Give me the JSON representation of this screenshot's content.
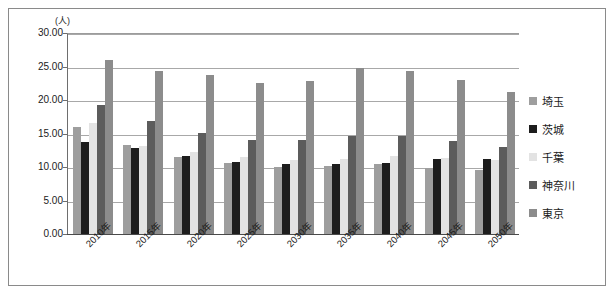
{
  "chart_data": {
    "type": "bar",
    "title": "",
    "subtitle": "",
    "xlabel": "",
    "ylabel": "",
    "unit_label": "(人)",
    "ylim": [
      0,
      30
    ],
    "ytick_step": 5,
    "ytick_labels": [
      "30.00",
      "25.00",
      "20.00",
      "15.00",
      "10.00",
      "5.00",
      "0.00"
    ],
    "ytick_values": [
      30,
      25,
      20,
      15,
      10,
      5,
      0
    ],
    "grid": true,
    "legend_position": "right",
    "categories": [
      "2010年",
      "2015年",
      "2020年",
      "2025年",
      "2030年",
      "2035年",
      "2040年",
      "2045年",
      "2050年"
    ],
    "series": [
      {
        "name": "埼玉",
        "color": "#9e9e9e",
        "values": [
          15.9,
          13.3,
          11.5,
          10.6,
          10.0,
          10.1,
          10.4,
          9.9,
          9.6
        ]
      },
      {
        "name": "茨城",
        "color": "#1d1d1d",
        "values": [
          13.7,
          12.9,
          11.6,
          10.8,
          10.4,
          10.4,
          10.6,
          11.2,
          11.2
        ]
      },
      {
        "name": "千葉",
        "color": "#e3e3e3",
        "values": [
          16.6,
          13.1,
          12.2,
          11.5,
          11.0,
          11.2,
          11.6,
          11.4,
          11.0
        ]
      },
      {
        "name": "神奈川",
        "color": "#5c5c5c",
        "values": [
          19.3,
          16.8,
          15.1,
          14.0,
          14.0,
          14.7,
          14.6,
          13.9,
          13.0
        ]
      },
      {
        "name": "東京",
        "color": "#8c8c8c",
        "values": [
          26.0,
          24.4,
          23.8,
          22.6,
          22.9,
          24.8,
          24.4,
          23.0,
          21.2
        ]
      }
    ]
  },
  "legend": {
    "items": [
      {
        "label": "埼玉",
        "color": "#9e9e9e"
      },
      {
        "label": "茨城",
        "color": "#1d1d1d"
      },
      {
        "label": "千葉",
        "color": "#e3e3e3"
      },
      {
        "label": "神奈川",
        "color": "#5c5c5c"
      },
      {
        "label": "東京",
        "color": "#8c8c8c"
      }
    ]
  }
}
